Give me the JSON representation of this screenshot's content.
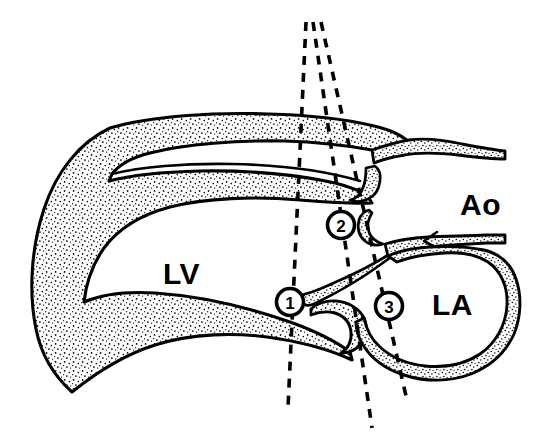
{
  "figure": {
    "background_color": "#ffffff",
    "ink_color": "#000000",
    "wall_fill": "stippled"
  },
  "labels": {
    "lv": "LV",
    "la": "LA",
    "ao": "Ao"
  },
  "markers": [
    {
      "id": "1",
      "number": "1",
      "cx": 290,
      "cy": 302
    },
    {
      "id": "2",
      "number": "2",
      "cx": 341,
      "cy": 225
    },
    {
      "id": "3",
      "number": "3",
      "cx": 389,
      "cy": 306
    }
  ],
  "scan_lines": [
    {
      "id": "scan-line-1",
      "label": "1",
      "apex_x": 306,
      "apex_y": 22,
      "end_x": 288,
      "end_y": 408
    },
    {
      "id": "scan-line-2",
      "label": "2",
      "apex_x": 313,
      "apex_y": 22,
      "end_x": 372,
      "end_y": 428
    },
    {
      "id": "scan-line-3",
      "label": "3",
      "apex_x": 321,
      "apex_y": 22,
      "end_x": 406,
      "end_y": 396
    }
  ],
  "structures": [
    {
      "name": "left-ventricle-cavity",
      "label": "LV"
    },
    {
      "name": "left-atrium-cavity",
      "label": "LA"
    },
    {
      "name": "aorta-lumen",
      "label": "Ao"
    },
    {
      "name": "interventricular-septum",
      "label": ""
    },
    {
      "name": "posterior-wall",
      "label": ""
    },
    {
      "name": "anterior-mitral-leaflet",
      "label": ""
    },
    {
      "name": "posterior-mitral-leaflet",
      "label": ""
    },
    {
      "name": "aortic-valve-cusps",
      "label": ""
    }
  ]
}
